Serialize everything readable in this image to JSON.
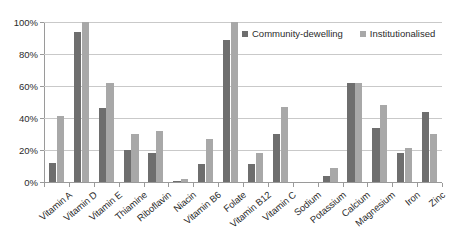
{
  "chart_data": {
    "type": "bar",
    "title": "",
    "xlabel": "",
    "ylabel": "",
    "ylim": [
      0,
      100
    ],
    "yticks": [
      0,
      20,
      40,
      60,
      80,
      100
    ],
    "ytick_labels": [
      "0%",
      "20%",
      "40%",
      "60%",
      "80%",
      "100%"
    ],
    "grid": true,
    "legend_position": "top-right",
    "categories": [
      "Vitamin A",
      "Vitamin D",
      "Vitamin E",
      "Thiamine",
      "Riboflavin",
      "Niacin",
      "Vitamin B6",
      "Folate",
      "Vitamin B12",
      "Vitamin C",
      "Sodium",
      "Potassium",
      "Calcium",
      "Magnesium",
      "Iron",
      "Zinc"
    ],
    "series": [
      {
        "name": "Community-dewelling",
        "color": "#6e6e6e",
        "values": [
          12,
          94,
          46,
          20,
          18,
          0.5,
          11,
          89,
          11,
          30,
          0,
          4,
          62,
          34,
          18,
          44
        ]
      },
      {
        "name": "Institutionalised",
        "color": "#a8a8a8",
        "values": [
          41,
          100,
          62,
          30,
          32,
          2,
          27,
          100,
          18,
          47,
          0,
          9,
          62,
          48,
          21,
          30
        ]
      }
    ]
  }
}
